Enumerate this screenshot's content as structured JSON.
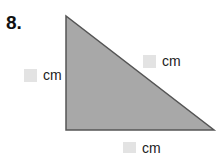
{
  "problem": {
    "number": "8.",
    "shape": "right-triangle",
    "colors": {
      "fill": "#a8a8a8",
      "stroke": "#555555",
      "answer_box": "#e3e3e3"
    },
    "labels": {
      "left": {
        "value": "",
        "unit": "cm"
      },
      "hypotenuse": {
        "value": "",
        "unit": "cm"
      },
      "bottom": {
        "value": "",
        "unit": "cm"
      }
    }
  }
}
